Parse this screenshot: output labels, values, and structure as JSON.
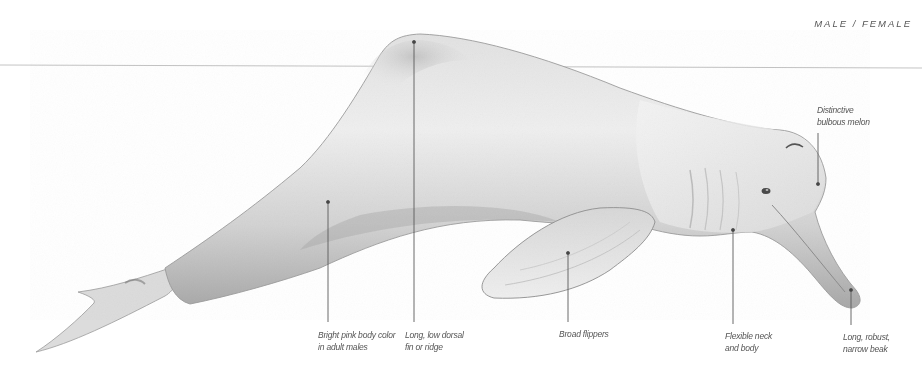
{
  "header": {
    "sex_label": "MALE / FEMALE"
  },
  "colors": {
    "background": "#ffffff",
    "waterline": "#bdbdbd",
    "body_light": "#f1f1f1",
    "body_mid": "#d6d6d6",
    "body_dark": "#9a9a9a",
    "leader": "#555555",
    "label_text": "#555555"
  },
  "diagram": {
    "annotations": [
      {
        "id": "body-color",
        "lines": [
          "Bright pink body color",
          "in adult males"
        ]
      },
      {
        "id": "dorsal",
        "lines": [
          "Long, low dorsal",
          "fin or ridge"
        ]
      },
      {
        "id": "flippers",
        "lines": [
          "Broad flippers"
        ]
      },
      {
        "id": "neck",
        "lines": [
          "Flexible neck",
          "and body"
        ]
      },
      {
        "id": "beak",
        "lines": [
          "Long, robust,",
          "narrow beak"
        ]
      },
      {
        "id": "melon",
        "lines": [
          "Distinctive",
          "bulbous melon"
        ]
      }
    ]
  }
}
